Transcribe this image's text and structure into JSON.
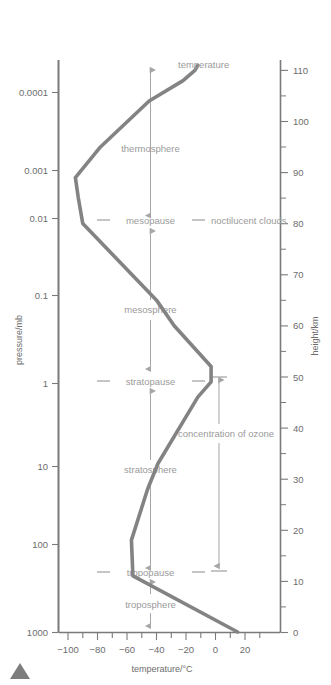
{
  "chart_data": {
    "type": "line",
    "title": "",
    "xlabel": "temperature/°C",
    "ylabel": "pressure/mb",
    "y2label": "height/km",
    "xlim": [
      -105,
      30
    ],
    "xticks": [
      -100,
      -80,
      -60,
      -40,
      -20,
      0,
      20
    ],
    "xtick_labels": [
      "−100",
      "−80",
      "−60",
      "−40",
      "−20",
      "0",
      "20"
    ],
    "xtick_minor_step": 10,
    "pressure_axis": {
      "label": "pressure/mb",
      "scale": "log",
      "ticks": [
        0.0001,
        0.001,
        0.01,
        0.1,
        1,
        10,
        100,
        1000
      ],
      "tick_labels": [
        "0.0001",
        "0.001",
        "0.01",
        "0.1",
        "1",
        "10",
        "100",
        "1000"
      ]
    },
    "height_axis": {
      "label": "height/km",
      "scale": "linear",
      "lim": [
        0,
        113
      ],
      "ticks": [
        0,
        10,
        20,
        30,
        40,
        50,
        60,
        70,
        80,
        90,
        100,
        110
      ],
      "tick_labels": [
        "0",
        "10",
        "20",
        "30",
        "40",
        "50",
        "60",
        "70",
        "80",
        "90",
        "100",
        "110"
      ],
      "minor_step": 5
    },
    "grid": false,
    "legend": "none",
    "series": [
      {
        "name": "temperature",
        "label": "temperature",
        "color": "#838383",
        "points": [
          {
            "temperature": 15,
            "height": 0
          },
          {
            "temperature": -56,
            "height": 11
          },
          {
            "temperature": -57,
            "height": 18
          },
          {
            "temperature": -46,
            "height": 28
          },
          {
            "temperature": -39,
            "height": 33
          },
          {
            "temperature": -12,
            "height": 46
          },
          {
            "temperature": -3,
            "height": 49
          },
          {
            "temperature": -3,
            "height": 52
          },
          {
            "temperature": -28,
            "height": 60
          },
          {
            "temperature": -40,
            "height": 65
          },
          {
            "temperature": -90,
            "height": 80
          },
          {
            "temperature": -93,
            "height": 85
          },
          {
            "temperature": -95,
            "height": 89
          },
          {
            "temperature": -78,
            "height": 95
          },
          {
            "temperature": -45,
            "height": 104
          },
          {
            "temperature": -22,
            "height": 108
          },
          {
            "temperature": -14,
            "height": 110
          },
          {
            "temperature": -12,
            "height": 111
          }
        ]
      }
    ],
    "layers": [
      {
        "name": "thermosphere",
        "label": "thermosphere",
        "from_height": 80,
        "to_height": 113,
        "arrow": "double"
      },
      {
        "name": "mesosphere",
        "label": "mesosphere",
        "from_height": 50,
        "to_height": 80,
        "arrow": "double"
      },
      {
        "name": "stratosphere",
        "label": "stratosphere",
        "from_height": 11,
        "to_height": 50,
        "arrow": "double"
      },
      {
        "name": "troposphere",
        "label": "troposphere",
        "from_height": 0,
        "to_height": 11,
        "arrow": "double"
      }
    ],
    "boundaries": [
      {
        "name": "mesopause",
        "label": "mesopause",
        "height": 80
      },
      {
        "name": "stratopause",
        "label": "stratopause",
        "height": 50
      },
      {
        "name": "tropopause",
        "label": "tropopause",
        "height": 11
      }
    ],
    "annotations": [
      {
        "name": "noctilucent-clouds",
        "label": "noctilucent clouds",
        "height": 80
      },
      {
        "name": "concentration-of-ozone",
        "label": "concentration of ozone",
        "from_height": 11,
        "to_height": 50,
        "arrow": "double-barred"
      }
    ],
    "colors": {
      "curve": "#838383",
      "axis": "#7a7a7a",
      "tick_text": "#6d6d6d",
      "annotation": "#9a9a9a",
      "caption_marker": "#7d7d7d"
    }
  }
}
